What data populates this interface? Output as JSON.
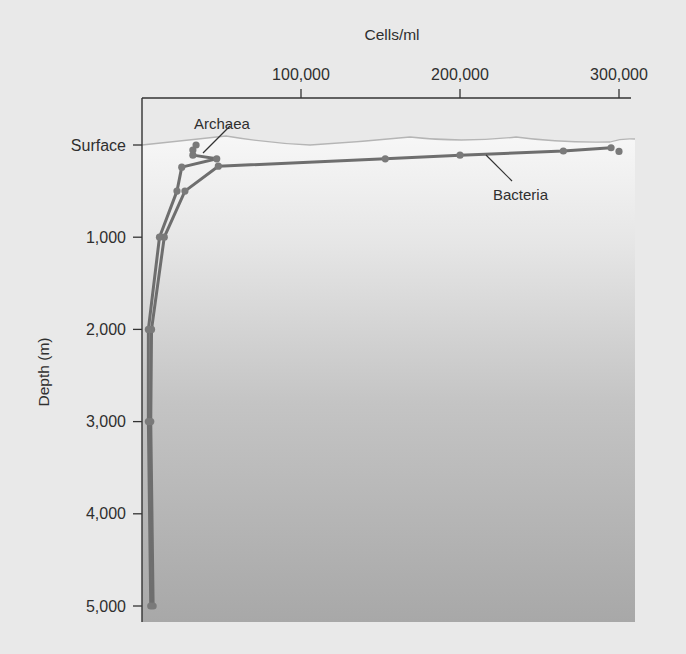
{
  "chart_data": {
    "type": "line",
    "title": "",
    "xlabel": "Cells/ml",
    "ylabel": "Depth (m)",
    "x_axis_position": "top",
    "xlim": [
      0,
      310000
    ],
    "ylim": [
      5000,
      0
    ],
    "x_ticks": [
      {
        "value": 100000,
        "label": "100,000"
      },
      {
        "value": 200000,
        "label": "200,000"
      },
      {
        "value": 300000,
        "label": "300,000"
      }
    ],
    "y_ticks": [
      {
        "value": 0,
        "label": "Surface"
      },
      {
        "value": 1000,
        "label": "1,000"
      },
      {
        "value": 2000,
        "label": "2,000"
      },
      {
        "value": 3000,
        "label": "3,000"
      },
      {
        "value": 4000,
        "label": "4,000"
      },
      {
        "value": 5000,
        "label": "5,000"
      }
    ],
    "grid": false,
    "legend": "direct labels",
    "series": [
      {
        "name": "Bacteria",
        "label_anchor": {
          "x": 215000,
          "depth": 430
        },
        "points": [
          {
            "x": 295000,
            "depth": 30
          },
          {
            "x": 265000,
            "depth": 65
          },
          {
            "x": 200000,
            "depth": 110
          },
          {
            "x": 153000,
            "depth": 150
          },
          {
            "x": 48000,
            "depth": 230
          },
          {
            "x": 27000,
            "depth": 500
          },
          {
            "x": 14000,
            "depth": 1000
          },
          {
            "x": 6000,
            "depth": 2000
          },
          {
            "x": 5500,
            "depth": 3000
          },
          {
            "x": 7000,
            "depth": 5000
          }
        ],
        "extra_point": {
          "x": 300000,
          "depth": 70
        }
      },
      {
        "name": "Archaea",
        "label_anchor": {
          "x": 56000,
          "depth": -200
        },
        "points": [
          {
            "x": 34000,
            "depth": 0
          },
          {
            "x": 32000,
            "depth": 55
          },
          {
            "x": 32000,
            "depth": 110
          },
          {
            "x": 47000,
            "depth": 150
          },
          {
            "x": 25000,
            "depth": 240
          },
          {
            "x": 22000,
            "depth": 500
          },
          {
            "x": 11000,
            "depth": 1000
          },
          {
            "x": 4000,
            "depth": 2000
          },
          {
            "x": 4000,
            "depth": 3000
          },
          {
            "x": 5500,
            "depth": 5000
          }
        ]
      }
    ],
    "colors": {
      "page_bg": "#e9e9e9",
      "water_top": "#f6f6f6",
      "water_bottom": "#a9a9a9",
      "line": "#6e6e6e",
      "marker": "#7a7a7a",
      "axis": "#333333",
      "surface_wave": "#b5b5b5"
    }
  }
}
